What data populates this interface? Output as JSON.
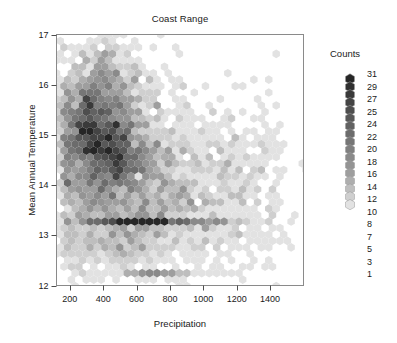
{
  "chart_data": {
    "type": "heatmap",
    "subtype": "hexbin",
    "title": "Coast Range",
    "xlabel": "Precipitation",
    "ylabel": "Mean Annual Temperature",
    "xlim": [
      120,
      1600
    ],
    "ylim": [
      12,
      17
    ],
    "xticks": [
      200,
      400,
      600,
      800,
      1000,
      1200,
      1400
    ],
    "xtick_labels": [
      "200",
      "400",
      "600",
      "800",
      "1000",
      "1200",
      "1400"
    ],
    "yticks": [
      12,
      13,
      14,
      15,
      16,
      17
    ],
    "ytick_labels": [
      "12",
      "13",
      "14",
      "15",
      "16",
      "17"
    ],
    "grid": false,
    "legend": {
      "title": "Counts",
      "position": "right",
      "entries": [
        {
          "count": 31,
          "color": "#262626"
        },
        {
          "count": 29,
          "color": "#303030"
        },
        {
          "count": 27,
          "color": "#3a3a3a"
        },
        {
          "count": 25,
          "color": "#444444"
        },
        {
          "count": 24,
          "color": "#4e4e4e"
        },
        {
          "count": 22,
          "color": "#585858"
        },
        {
          "count": 20,
          "color": "#626262"
        },
        {
          "count": 18,
          "color": "#6c6c6c"
        },
        {
          "count": 16,
          "color": "#767676"
        },
        {
          "count": 14,
          "color": "#808080"
        },
        {
          "count": 12,
          "color": "#8a8a8a"
        },
        {
          "count": 10,
          "color": "#949494"
        },
        {
          "count": 8,
          "color": "#9e9e9e"
        },
        {
          "count": 7,
          "color": "#aeaeae"
        },
        {
          "count": 5,
          "color": "#bebebe"
        },
        {
          "count": 3,
          "color": "#cfcfcf"
        },
        {
          "count": 1,
          "color": "#e2e2e2"
        }
      ]
    },
    "hex_radius_px": 4.3,
    "count_min": 1,
    "count_max": 31,
    "clusters": [
      {
        "cx": 400,
        "cy": 14.85,
        "sx": 150,
        "sy": 0.62,
        "n": 1250,
        "w": 1.0
      },
      {
        "cx": 330,
        "cy": 15.35,
        "sx": 95,
        "sy": 0.45,
        "n": 620,
        "w": 1.0
      },
      {
        "cx": 470,
        "cy": 14.55,
        "sx": 130,
        "sy": 0.38,
        "n": 520,
        "w": 1.0
      },
      {
        "cx": 560,
        "cy": 14.3,
        "sx": 230,
        "sy": 0.8,
        "n": 640,
        "w": 1.0
      },
      {
        "cx": 820,
        "cy": 13.85,
        "sx": 290,
        "sy": 0.62,
        "n": 380,
        "w": 1.0
      },
      {
        "cx": 420,
        "cy": 13.0,
        "sx": 190,
        "sy": 0.42,
        "n": 330,
        "w": 1.0
      },
      {
        "cx": 700,
        "cy": 13.55,
        "sx": 330,
        "sy": 0.45,
        "n": 290,
        "w": 1.0
      },
      {
        "cx": 430,
        "cy": 16.0,
        "sx": 140,
        "sy": 0.38,
        "n": 300,
        "w": 1.0
      },
      {
        "cx": 360,
        "cy": 16.45,
        "sx": 110,
        "sy": 0.3,
        "n": 110,
        "w": 1.0
      },
      {
        "cx": 1150,
        "cy": 14.4,
        "sx": 220,
        "sy": 0.55,
        "n": 110,
        "w": 1.0
      }
    ],
    "bands": [
      {
        "y": 13.3,
        "x_from": 180,
        "x_to": 1560,
        "n": 430,
        "decay": 0.0016,
        "peak_x": 640
      },
      {
        "y": 12.2,
        "x_from": 520,
        "x_to": 1330,
        "n": 95,
        "decay": 0.003,
        "peak_x": 700
      }
    ]
  },
  "chart": {
    "title": "Coast Range",
    "xlabel": "Precipitation",
    "ylabel": "Mean Annual Temperature",
    "legend_title": "Counts"
  }
}
